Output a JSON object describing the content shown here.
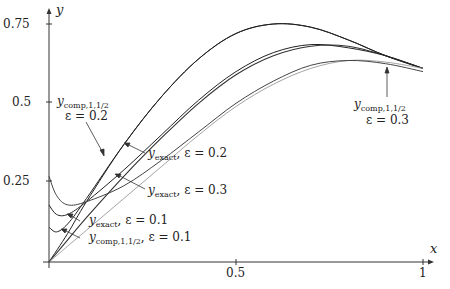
{
  "chart_data": {
    "type": "line",
    "title": "",
    "xlabel": "x",
    "ylabel": "y",
    "xlim": [
      0,
      1
    ],
    "ylim": [
      0,
      0.78
    ],
    "xticks": [
      "0.5",
      "1"
    ],
    "yticks": [
      "0.25",
      "0.5",
      "0.75"
    ],
    "grid": false,
    "series": [
      {
        "name": "y_exact, ε = 0.1",
        "x": [
          0,
          0.05,
          0.1,
          0.2,
          0.3,
          0.4,
          0.5,
          0.6,
          0.7,
          0.8,
          0.9,
          1
        ],
        "values": [
          0,
          0.09,
          0.19,
          0.37,
          0.52,
          0.64,
          0.72,
          0.75,
          0.74,
          0.7,
          0.65,
          0.61
        ]
      },
      {
        "name": "y_comp,1,1/2, ε = 0.1",
        "x": [
          0,
          0.02,
          0.05,
          0.1,
          0.2,
          0.3,
          0.4,
          0.5,
          0.6,
          0.7,
          0.8,
          0.9,
          1
        ],
        "values": [
          0.11,
          0.095,
          0.12,
          0.2,
          0.37,
          0.52,
          0.64,
          0.72,
          0.75,
          0.74,
          0.7,
          0.65,
          0.61
        ]
      },
      {
        "name": "y_exact, ε = 0.2",
        "x": [
          0,
          0.05,
          0.1,
          0.2,
          0.3,
          0.4,
          0.5,
          0.6,
          0.7,
          0.8,
          0.9,
          1
        ],
        "values": [
          0,
          0.07,
          0.14,
          0.27,
          0.39,
          0.5,
          0.59,
          0.65,
          0.68,
          0.68,
          0.65,
          0.61
        ]
      },
      {
        "name": "y_comp,1,1/2, ε = 0.2",
        "x": [
          0,
          0.02,
          0.05,
          0.1,
          0.2,
          0.3,
          0.4,
          0.5,
          0.6,
          0.7,
          0.8,
          0.9,
          1
        ],
        "values": [
          0.18,
          0.15,
          0.15,
          0.19,
          0.29,
          0.4,
          0.51,
          0.6,
          0.66,
          0.685,
          0.675,
          0.65,
          0.61
        ]
      },
      {
        "name": "y_exact, ε = 0.3",
        "x": [
          0,
          0.05,
          0.1,
          0.2,
          0.3,
          0.4,
          0.5,
          0.6,
          0.7,
          0.8,
          0.9,
          1
        ],
        "values": [
          0,
          0.05,
          0.1,
          0.2,
          0.3,
          0.4,
          0.49,
          0.56,
          0.61,
          0.635,
          0.63,
          0.61
        ]
      },
      {
        "name": "y_comp,1,1/2, ε = 0.3",
        "x": [
          0,
          0.02,
          0.05,
          0.1,
          0.2,
          0.3,
          0.4,
          0.5,
          0.6,
          0.7,
          0.8,
          0.9,
          1
        ],
        "values": [
          0.27,
          0.21,
          0.18,
          0.19,
          0.24,
          0.32,
          0.41,
          0.5,
          0.57,
          0.62,
          0.635,
          0.625,
          0.6
        ]
      }
    ],
    "annotations": [
      "y_comp,1,1/2  ε = 0.2",
      "y_exact, ε = 0.2",
      "y_exact, ε = 0.3",
      "y_exact, ε = 0.1",
      "y_comp,1,1/2, ε = 0.1",
      "y_comp,1,1/2  ε = 0.3"
    ]
  },
  "axes": {
    "x_label": "x",
    "y_label": "y",
    "x_ticks": [
      "0.5",
      "1"
    ],
    "y_ticks": [
      "0.25",
      "0.5",
      "0.75"
    ]
  },
  "labels": {
    "comp02_main": "y",
    "comp02_sub": "comp,1,1/2",
    "comp02_eps": "ε = 0.2",
    "exact02_main": "y",
    "exact02_sub": "exact",
    "exact02_eps": ", ε = 0.2",
    "exact03_main": "y",
    "exact03_sub": "exact",
    "exact03_eps": ", ε = 0.3",
    "exact01_main": "y",
    "exact01_sub": "exact",
    "exact01_eps": ", ε = 0.1",
    "comp01_main": "y",
    "comp01_sub": "comp,1,1/2",
    "comp01_eps": ", ε = 0.1",
    "comp03_main": "y",
    "comp03_sub": "comp,1,1/2",
    "comp03_eps": "ε = 0.3"
  }
}
